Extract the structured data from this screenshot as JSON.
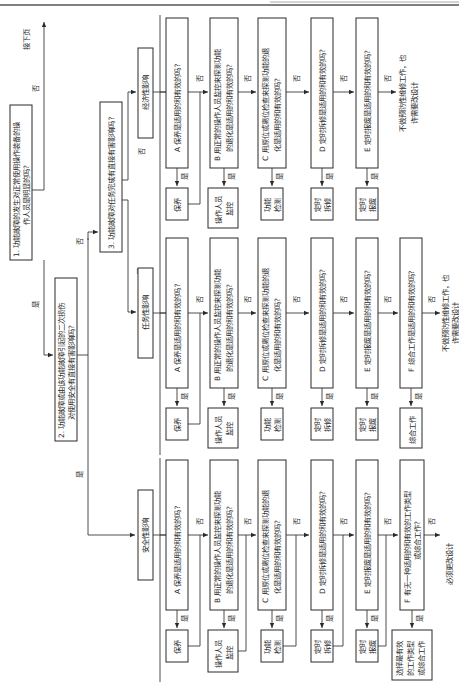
{
  "top_rule": true,
  "continue_label": "接下页",
  "q1": {
    "line1": "1. 功能故障的发生对正常使用操作装备的操",
    "line2": "作人员是明显的吗?"
  },
  "q2": {
    "line1": "2. 功能故障或由该功能故障引起的二次损伤",
    "line2": "对使用安全有直接有害影响吗?"
  },
  "q3": {
    "line1": "3. 功能故障对任务完成有直接有害影响吗?"
  },
  "yes": "是",
  "no": "否",
  "branches": {
    "economic": {
      "title": "经济性影响",
      "questions": [
        {
          "l1": "A 保养是适用的和有效的吗?",
          "l2": ""
        },
        {
          "l1": "B 用正常的操作人员监控来探测功能",
          "l2": "的退化是适用的和有效的吗?"
        },
        {
          "l1": "C 用原位或离位检查来探测功能的退",
          "l2": "化是适用的和有效的吗?"
        },
        {
          "l1": "D 定时拆修是适用的和有效的吗?",
          "l2": ""
        },
        {
          "l1": "E 定时报废是适用的和有效的吗?",
          "l2": ""
        }
      ],
      "actions": [
        [
          "保养"
        ],
        [
          "操作人员",
          "监控"
        ],
        [
          "功能",
          "检测"
        ],
        [
          "定时",
          "拆修"
        ],
        [
          "定时",
          "报废"
        ]
      ],
      "end": {
        "l1": "不做预防性维修工作，也",
        "l2": "许需要改设计"
      }
    },
    "mission": {
      "title": "任务性影响",
      "questions": [
        {
          "l1": "A 保养是适用的和有效的吗?",
          "l2": ""
        },
        {
          "l1": "B 用正常的操作人员监控来探测功能",
          "l2": "的退化是适用的和有效的吗?"
        },
        {
          "l1": "C 用原位或离位检查来探测功能的退",
          "l2": "化是适用的和有效的吗?"
        },
        {
          "l1": "D 定时拆修是适用的和有效的吗?",
          "l2": ""
        },
        {
          "l1": "E 定时报废是适用的和有效的吗?",
          "l2": ""
        },
        {
          "l1": "F 综合工作是适用的和有效的吗?",
          "l2": ""
        }
      ],
      "actions": [
        [
          "保养"
        ],
        [
          "操作人员",
          "监控"
        ],
        [
          "功能",
          "检测"
        ],
        [
          "定时",
          "拆修"
        ],
        [
          "定时",
          "报废"
        ],
        [
          "综合工作"
        ]
      ],
      "end": {
        "l1": "不做预防性维修工作，也",
        "l2": "许需要改设计"
      }
    },
    "safety": {
      "title": "安全性影响",
      "questions": [
        {
          "l1": "A 保养是适用的和有效的吗?",
          "l2": ""
        },
        {
          "l1": "B 用正常的操作人员监控来探测功能",
          "l2": "的退化是适用的和有效的吗?"
        },
        {
          "l1": "C 用原位或离位检查来探测功能的退",
          "l2": "化是适用的和有效的吗?"
        },
        {
          "l1": "D 定时拆修是适用的和有效的吗?",
          "l2": ""
        },
        {
          "l1": "E 定时报废是适用的和有效的吗?",
          "l2": ""
        },
        {
          "l1": "F 有无一种适用的和有效的工作类型",
          "l2": "或综合工作?"
        }
      ],
      "actions": [
        [
          "保养"
        ],
        [
          "操作人员",
          "监控"
        ],
        [
          "功能",
          "检测"
        ],
        [
          "定时",
          "拆修"
        ],
        [
          "定时",
          "报废"
        ],
        [
          "选择最有效",
          "的工作类型",
          "或综合工作"
        ]
      ],
      "end": {
        "l1": "必须更改设计",
        "l2": ""
      }
    }
  }
}
